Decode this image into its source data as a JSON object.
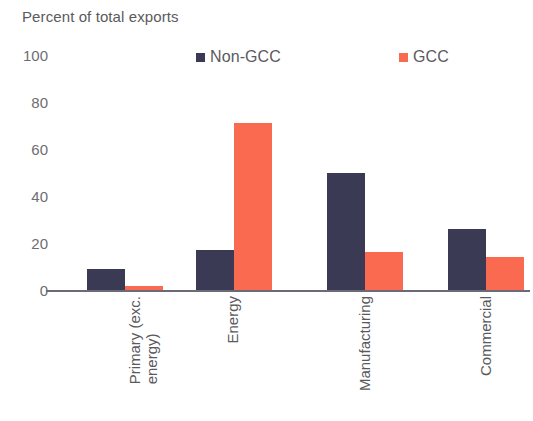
{
  "chart_data": {
    "type": "bar",
    "title": "Percent of total exports",
    "xlabel": "",
    "ylabel": "",
    "ylim": [
      0,
      100
    ],
    "yticks": [
      0,
      20,
      40,
      60,
      80,
      100
    ],
    "grid": false,
    "legend_position": "top",
    "categories": [
      "Primary (exc. energy)",
      "Energy",
      "Manufacturing",
      "Commercial"
    ],
    "category_lines": [
      [
        "Primary (exc.",
        "energy)"
      ],
      [
        "Energy"
      ],
      [
        "Manufacturing"
      ],
      [
        "Commercial"
      ]
    ],
    "series": [
      {
        "name": "Non-GCC",
        "color": "#3a3a55",
        "values": [
          9,
          17,
          50,
          26
        ]
      },
      {
        "name": "GCC",
        "color": "#f96a50",
        "values": [
          1.5,
          71,
          16,
          14
        ]
      }
    ]
  },
  "axis": {
    "tick_100": "100",
    "tick_80": "80",
    "tick_60": "60",
    "tick_40": "40",
    "tick_20": "20",
    "tick_0": "0"
  }
}
